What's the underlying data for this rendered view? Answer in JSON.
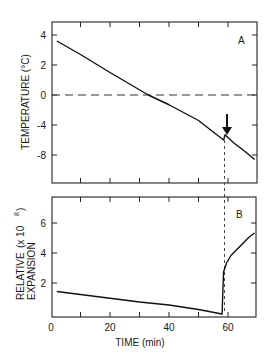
{
  "chart_data": [
    {
      "panel": "A",
      "type": "line",
      "title": "",
      "panel_label": "A",
      "xlabel": "TIME (min)",
      "ylabel": "TEMPERATURE (°C)",
      "xlim": [
        0,
        70
      ],
      "y_ticks": [
        4,
        2,
        0,
        -4,
        -8
      ],
      "y_tick_labels": [
        "4",
        "2",
        "0",
        "-4",
        "-8"
      ],
      "y_scale_note": "broken scale: 15 px/unit above 0, 7.5 px/unit below 0",
      "grid": false,
      "reference_line": {
        "y": 0,
        "style": "dashed"
      },
      "annotation": {
        "type": "arrow",
        "x": 59,
        "direction": "down"
      },
      "series": [
        {
          "name": "temperature",
          "x": [
            2,
            10,
            20,
            33,
            40,
            50,
            58.5,
            59,
            62,
            66,
            69
          ],
          "y": [
            3.6,
            2.7,
            1.5,
            0.0,
            -1.3,
            -3.4,
            -6.0,
            -5.3,
            -6.4,
            -7.6,
            -8.6
          ]
        }
      ]
    },
    {
      "panel": "B",
      "type": "line",
      "title": "",
      "panel_label": "B",
      "xlabel": "TIME (min)",
      "ylabel": "RELATIVE EXPANSION (x 10^8)",
      "xlim": [
        0,
        70
      ],
      "ylim": [
        0,
        8
      ],
      "x_ticks": [
        0,
        20,
        40,
        60
      ],
      "y_ticks": [
        2,
        4,
        6
      ],
      "grid": false,
      "series": [
        {
          "name": "relative expansion",
          "x": [
            2,
            10,
            20,
            30,
            40,
            50,
            58,
            58.3,
            58.5,
            59.5,
            61,
            64,
            67,
            69
          ],
          "y": [
            1.7,
            1.5,
            1.25,
            1.0,
            0.8,
            0.5,
            0.2,
            2.0,
            3.0,
            3.6,
            4.1,
            4.7,
            5.3,
            5.6
          ]
        }
      ]
    }
  ],
  "labels": {
    "panel_a": "A",
    "panel_b": "B",
    "y_label_a": "TEMPERATURE  (°C)",
    "y_label_b_line1": "RELATIVE",
    "y_label_b_line2": "EXPANSION",
    "y_label_b_unit": "(x  10",
    "y_label_b_exp": "8",
    "y_label_b_close": ")",
    "x_label": "TIME   (min)",
    "x_tick_labels": [
      "0",
      "20",
      "40",
      "60"
    ],
    "y_tick_labels_a": [
      "4",
      "2",
      "0",
      "-4",
      "-8"
    ],
    "y_tick_labels_b": [
      "6",
      "4",
      "2"
    ]
  }
}
